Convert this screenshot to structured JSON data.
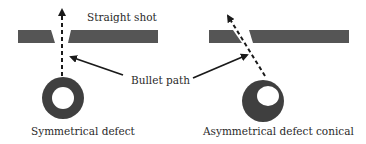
{
  "labels": {
    "straight_shot": "Straight shot",
    "bullet_path": "Bullet path",
    "symmetrical": "Symmetrical defect",
    "asymmetrical": "Asymmetrical defect conical"
  },
  "colors": {
    "plate": "#555555",
    "defect": "#3f3f3f",
    "arrow": "#1a1a1a",
    "text": "#2a2a2a"
  }
}
